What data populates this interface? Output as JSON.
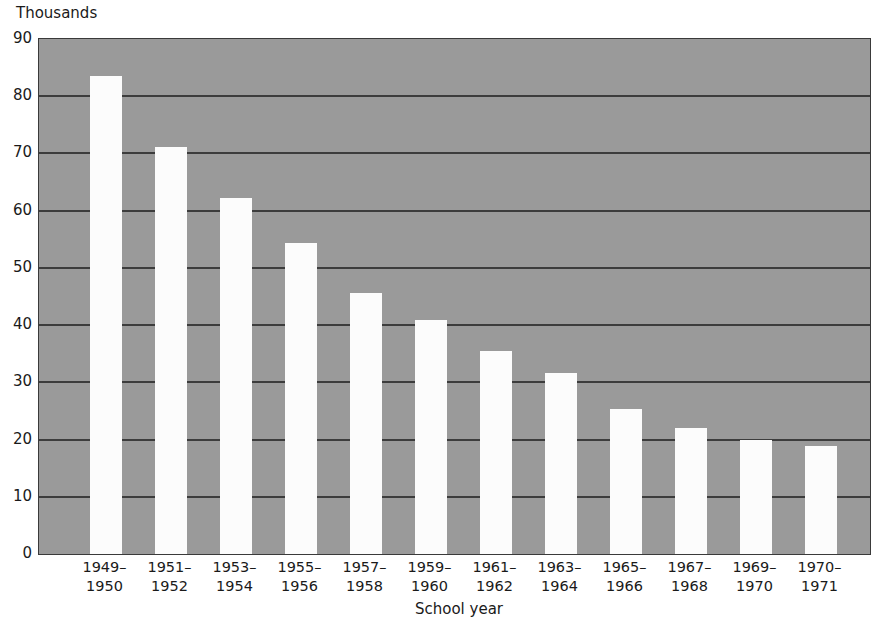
{
  "chart_data": {
    "type": "bar",
    "title": "",
    "subtitle": "",
    "unit_caption": "Thousands",
    "xlabel": "School year",
    "ylabel": "",
    "ylim": [
      0,
      90
    ],
    "y_ticks": [
      0,
      10,
      20,
      30,
      40,
      50,
      60,
      70,
      80,
      90
    ],
    "y_tick_labels": [
      "0",
      "10",
      "20",
      "30",
      "40",
      "50",
      "60",
      "70",
      "80",
      "90"
    ],
    "grid": true,
    "legend": null,
    "legend_position": "none",
    "categories": [
      "1949–\n1950",
      "1951–\n1952",
      "1953–\n1954",
      "1955–\n1956",
      "1957–\n1958",
      "1959–\n1960",
      "1961–\n1962",
      "1963–\n1964",
      "1965–\n1966",
      "1967–\n1968",
      "1969–\n1970",
      "1970–\n1971"
    ],
    "category_lines": [
      [
        "1949–",
        "1950"
      ],
      [
        "1951–",
        "1952"
      ],
      [
        "1953–",
        "1954"
      ],
      [
        "1955–",
        "1956"
      ],
      [
        "1957–",
        "1958"
      ],
      [
        "1959–",
        "1960"
      ],
      [
        "1961–",
        "1962"
      ],
      [
        "1963–",
        "1964"
      ],
      [
        "1965–",
        "1966"
      ],
      [
        "1967–",
        "1968"
      ],
      [
        "1969–",
        "1970"
      ],
      [
        "1970–",
        "1971"
      ]
    ],
    "values": [
      83.5,
      71.2,
      62.2,
      54.3,
      45.6,
      40.9,
      35.4,
      31.6,
      25.3,
      22.0,
      20.0,
      18.8
    ],
    "bar_color": "#fcfcfc",
    "plot_background_color": "#9a9a9a",
    "gridline_color": "#3c3c3c",
    "axis_color": "#3a3a3a",
    "text_color": "#1a1a1a"
  }
}
